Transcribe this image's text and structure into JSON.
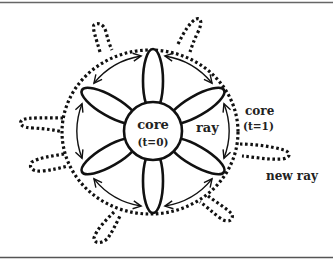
{
  "diagram": {
    "labels": {
      "core_initial": "core",
      "core_initial_time": "(t=0)",
      "ray": "ray",
      "core_next": "core",
      "core_next_time": "(t=1)",
      "new_ray": "new ray"
    },
    "petal_count": 6,
    "new_ray_count": 7,
    "arrow_pairs": 6,
    "colors": {
      "ink": "#111111",
      "background": "#ffffff",
      "rule": "#555555"
    }
  }
}
